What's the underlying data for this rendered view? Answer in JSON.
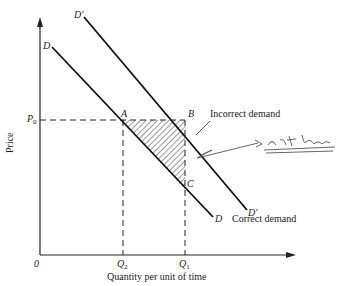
{
  "diagram": {
    "type": "supply-demand",
    "axes": {
      "y_label": "Price",
      "x_label": "Quantity per unit of time",
      "origin_label": "0"
    },
    "curves": [
      {
        "name": "D",
        "label_start": "D",
        "label_end": "D",
        "annotation": "Correct demand"
      },
      {
        "name": "D'",
        "label_start": "D′",
        "label_end": "D′",
        "annotation": "Incorrect demand"
      }
    ],
    "points": {
      "A": "A",
      "B": "B",
      "C": "C"
    },
    "price_level": {
      "main": "P",
      "sub": "0"
    },
    "quantities": [
      {
        "main": "Q",
        "sub": "2"
      },
      {
        "main": "Q",
        "sub": "1"
      }
    ],
    "shaded_region": "triangle ABC",
    "handwritten_note": "not here",
    "colors": {
      "ink": "#222222",
      "pencil": "#555555",
      "background": "#ffffff"
    }
  }
}
